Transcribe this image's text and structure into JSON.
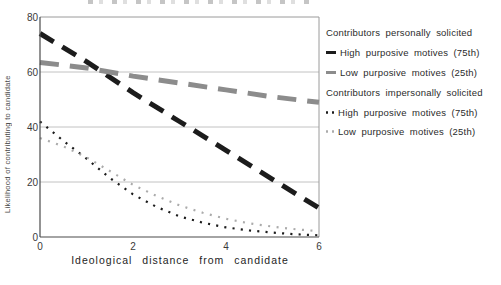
{
  "chart_data": {
    "type": "line",
    "title": "",
    "xlabel": "Ideological  distance  from  candidate",
    "ylabel": "Likelihood of contributing to candidate",
    "xlim": [
      0,
      6
    ],
    "ylim": [
      0,
      80
    ],
    "xticks": [
      0,
      2,
      4,
      6
    ],
    "yticks_top_to_bottom": [
      80,
      60,
      40,
      20,
      0
    ],
    "grid_y": [
      20,
      40,
      60
    ],
    "grid": "horizontal",
    "legend": {
      "position": "right",
      "groups": [
        {
          "header": "Contributors personally solicited",
          "items": [
            {
              "label": "High purposive motives (75th)",
              "marker": "thick-dash",
              "color": "#1c1c1c"
            },
            {
              "label": "Low purposive motives (25th)",
              "marker": "thick-dash",
              "color": "#8c8c8c"
            }
          ]
        },
        {
          "header": "Contributors impersonally solicited",
          "items": [
            {
              "label": "High purposive motives (75th)",
              "marker": "dots",
              "color": "#1c1c1c"
            },
            {
              "label": "Low purposive motives (25th)",
              "marker": "dots",
              "color": "#ababab"
            }
          ]
        }
      ]
    },
    "series": [
      {
        "name": "Personally solicited - high purposive motives (75th percentile)",
        "style": "dash-thick",
        "color": "#1c1c1c",
        "dash": "16 10",
        "x": [
          0,
          1,
          2,
          3,
          4,
          5,
          6
        ],
        "y": [
          74,
          63.8,
          52.5,
          42,
          31.5,
          21,
          10.5
        ]
      },
      {
        "name": "Personally solicited - low purposive motives (25th percentile)",
        "style": "dash-thick",
        "color": "#8c8c8c",
        "dash": "19 11",
        "x": [
          0,
          1,
          2,
          3,
          4,
          5,
          6
        ],
        "y": [
          63.5,
          61.5,
          58.5,
          56,
          53.5,
          51,
          49
        ]
      },
      {
        "name": "Impersonally solicited - high purposive motives (75th percentile)",
        "style": "dotted",
        "color": "#1c1c1c",
        "dash": "2.1 6.2",
        "x": [
          0,
          0.5,
          1,
          1.5,
          2,
          2.5,
          3,
          3.5,
          4,
          4.5,
          5,
          5.5,
          6
        ],
        "y": [
          42,
          35,
          28.5,
          21.5,
          15.5,
          11,
          7.5,
          5.2,
          3.5,
          2.4,
          1.6,
          1.0,
          0.6
        ]
      },
      {
        "name": "Impersonally solicited - low purposive motives (25th percentile)",
        "style": "dotted",
        "color": "#ababab",
        "dash": "2 6.5",
        "x": [
          0,
          0.5,
          1,
          1.5,
          2,
          2.5,
          3,
          3.5,
          4,
          4.5,
          5,
          5.5,
          6
        ],
        "y": [
          36,
          33,
          29,
          24,
          19,
          15,
          11.5,
          8.8,
          6.6,
          5,
          3.8,
          2.8,
          2.1
        ]
      }
    ]
  }
}
